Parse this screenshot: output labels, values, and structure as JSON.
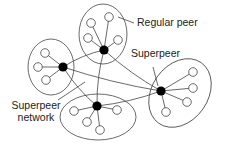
{
  "diagram": {
    "title": "Superpeer network",
    "labels": {
      "regular_peer": "Regular peer",
      "superpeer": "Superpeer",
      "superpeer_network_line1": "Superpeer",
      "superpeer_network_line2": "network"
    },
    "colors": {
      "stroke": "#444444",
      "superpeer_fill": "#000000",
      "regular_peer_fill": "#ffffff",
      "text": "#222222"
    },
    "clusters": [
      {
        "id": "top",
        "superpeer": [
          104,
          50
        ],
        "ellipse": {
          "cx": 103,
          "cy": 34,
          "rx": 24,
          "ry": 30,
          "rot": 0
        },
        "peers": [
          [
            91,
            23
          ],
          [
            109,
            17
          ],
          [
            88,
            38
          ],
          [
            118,
            40
          ]
        ]
      },
      {
        "id": "left",
        "superpeer": [
          63,
          67
        ],
        "ellipse": {
          "cx": 51,
          "cy": 67,
          "rx": 23,
          "ry": 28,
          "rot": 0
        },
        "peers": [
          [
            45,
            53
          ],
          [
            38,
            67
          ],
          [
            46,
            80
          ]
        ]
      },
      {
        "id": "bottom",
        "superpeer": [
          97,
          106
        ],
        "ellipse": {
          "cx": 98,
          "cy": 117,
          "rx": 38,
          "ry": 23,
          "rot": 0
        },
        "peers": [
          [
            74,
            111
          ],
          [
            87,
            122
          ],
          [
            100,
            130
          ],
          [
            117,
            110
          ]
        ]
      },
      {
        "id": "right",
        "superpeer": [
          161,
          91
        ],
        "ellipse": {
          "cx": 180,
          "cy": 93,
          "rx": 28,
          "ry": 37,
          "rot": 35
        },
        "peers": [
          [
            193,
            72
          ],
          [
            193,
            88
          ],
          [
            187,
            102
          ],
          [
            166,
            112
          ]
        ]
      }
    ],
    "superpeer_links": [
      [
        "top",
        "left"
      ],
      [
        "top",
        "bottom"
      ],
      [
        "top",
        "right"
      ],
      [
        "left",
        "bottom"
      ],
      [
        "left",
        "right"
      ],
      [
        "bottom",
        "right"
      ]
    ]
  }
}
